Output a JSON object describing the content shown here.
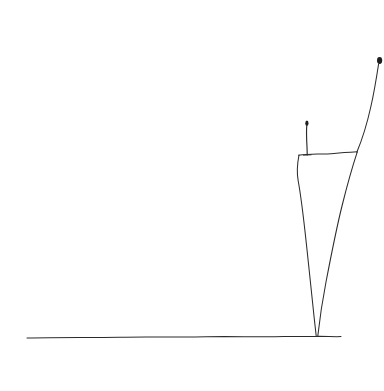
{
  "canvas": {
    "width": 384,
    "height": 391,
    "background_color": "#ffffff",
    "ink_color": "#2b2b2b",
    "medium": "hand-drawn pencil line sketch",
    "title": "Hand-drawn sketch: figure on cliff with ground line, circle and bird"
  },
  "scene": {
    "description": "Minimal hand-drawn line sketch on white paper: a horizontal wavy ground line, a tall tapering cliff or tower on the right with a tiny standing figure on its flat top, a long line rising off the top-right corner, an outlined circle at mid-left, and a small bird squiggle above it.",
    "elements": [
      {
        "name": "ground-line",
        "label": "Ground line",
        "kind": "stroke",
        "note": "Slightly wavy near-horizontal line across the lower part of the page",
        "path": "M 27 338 C 60 337.2, 92 337.8, 120 337.2 C 150 336.4, 178 337.6, 206 336.8 C 232 336.1, 258 337.4, 284 336.6 C 296 336.2, 306 336.6, 316 336.4 C 326 336.2, 334 337.0, 341 336.6"
      },
      {
        "name": "cliff-left-edge",
        "label": "Cliff left edge",
        "kind": "stroke",
        "note": "Left side of the tapering cliff, from the top ledge down to the ground",
        "path": "M 299 155 C 297.2 164, 296.6 172, 298.2 181 C 301 196, 303.6 218, 306.4 244 C 309 268, 311.8 296, 314.2 318 C 315.2 327, 315.8 332, 316.2 336"
      },
      {
        "name": "cliff-top-ledge",
        "label": "Cliff top ledge",
        "kind": "stroke",
        "note": "Near-horizontal flat top of the cliff that the figure stands on",
        "path": "M 298.6 155.2 C 310 153.4, 322 154.6, 334 153.4 C 343 152.6, 350 152.2, 357.2 151.8"
      },
      {
        "name": "cliff-right-edge",
        "label": "Cliff right edge",
        "kind": "stroke",
        "note": "Right side of the cliff converging down to the same ground point",
        "path": "M 357.2 152.2 C 352 168, 347 186, 342 206 C 336 230, 331 256, 326 282 C 322.5 300, 319.8 318, 317.8 336"
      },
      {
        "name": "rising-line",
        "label": "Rising line to upper right",
        "kind": "stroke",
        "note": "Long curve sweeping up from the cliff top ledge to a darker thickened tip near the top-right corner",
        "path": "M 356.8 152.2 C 362 140, 367 124, 371 106 C 374.2 92, 376.6 77, 378.6 64"
      },
      {
        "name": "rising-line-tip",
        "label": "Thick dark tip of rising line",
        "kind": "blob",
        "cx": 379.6,
        "cy": 60.5,
        "rx": 2.6,
        "ry": 3.4
      },
      {
        "name": "standing-figure",
        "label": "Tiny standing figure on the cliff top",
        "kind": "figure",
        "body_path": "M 306.8 125 C 306.2 132, 306.6 140, 307 147 C 307.2 151, 307.2 153.4, 307.2 155",
        "head_cx": 306.9,
        "head_cy": 123.2,
        "head_rx": 1.6,
        "head_ry": 2.6,
        "base_path": "M 303.4 155.2 L 311.2 154.8"
      },
      {
        "name": "circle-sun",
        "label": "Circle (sun or moon)",
        "kind": "circle",
        "cx": 124,
        "cy": 230.5,
        "rx": 14.2,
        "ry": 14.6,
        "path": "M 124 216 C 132.2 216, 138.4 222.4, 138.4 230.6 C 138.4 238.8, 132.2 245.2, 124 245.2 C 115.8 245.2, 109.6 238.8, 109.6 230.6 C 109.6 222.4, 115.8 216, 124 216 Z"
      },
      {
        "name": "bird-squiggle",
        "label": "Small bird squiggle",
        "kind": "stroke-group",
        "paths": [
          "M 71.5 196.5 C 73.5 200.5, 75.5 204, 77 207.5",
          "M 74.5 199.5 C 76.5 201.5, 78.5 203, 80.5 204",
          "M 76.5 203.5 C 80 202.5, 84 202.5, 88 203.5",
          "M 78.5 206.5 C 82 207, 85.5 207.5, 88.5 207",
          "M 88.5 202.8 C 90 204.2, 90.2 205.8, 88.8 207.2",
          "M 76 207.5 C 77.5 209.5, 79 211, 80.5 212"
        ]
      },
      {
        "name": "faint-mark",
        "label": "Faint stray pencil mark below the ground line",
        "kind": "stroke",
        "path": "M 334.6 348.5 L 335.4 352.2"
      }
    ]
  }
}
